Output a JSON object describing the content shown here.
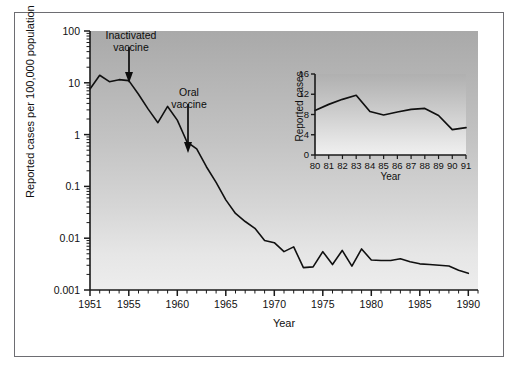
{
  "figure": {
    "background": "#ffffff",
    "frame_color": "#6d6d72",
    "panel_gradient_top": "#a9a9a9",
    "panel_gradient_bottom": "#ededed",
    "line_color": "#101010"
  },
  "chart_data": [
    {
      "type": "line",
      "id": "main-chart",
      "title": "",
      "xlabel": "Year",
      "ylabel": "Reported cases per 100,000 population",
      "yscale": "log",
      "ylim": [
        0.001,
        100
      ],
      "xlim": [
        1951,
        1991
      ],
      "grid": false,
      "legend": "none",
      "ytick_labels": [
        "100",
        "10",
        "1",
        "0.1",
        "0.01",
        "0.001"
      ],
      "ytick_values": [
        100,
        10,
        1,
        0.1,
        0.01,
        0.001
      ],
      "xtick_labels": [
        "1951",
        "1955",
        "1960",
        "1965",
        "1970",
        "1975",
        "1980",
        "1985",
        "1990"
      ],
      "xtick_values": [
        1951,
        1955,
        1960,
        1965,
        1970,
        1975,
        1980,
        1985,
        1990
      ],
      "x": [
        1951,
        1952,
        1953,
        1954,
        1955,
        1956,
        1957,
        1958,
        1959,
        1960,
        1961,
        1962,
        1963,
        1964,
        1965,
        1966,
        1967,
        1968,
        1969,
        1970,
        1971,
        1972,
        1973,
        1974,
        1975,
        1976,
        1977,
        1978,
        1979,
        1980,
        1981,
        1982,
        1983,
        1984,
        1985,
        1986,
        1987,
        1988,
        1989,
        1990
      ],
      "values": [
        7.6,
        14.0,
        10.5,
        11.5,
        11.0,
        6.0,
        3.1,
        1.7,
        3.5,
        1.9,
        0.72,
        0.53,
        0.24,
        0.12,
        0.055,
        0.03,
        0.021,
        0.0155,
        0.009,
        0.0082,
        0.0055,
        0.0068,
        0.0027,
        0.0028,
        0.0055,
        0.0031,
        0.0058,
        0.0029,
        0.0062,
        0.0038,
        0.0037,
        0.0037,
        0.004,
        0.0035,
        0.0032,
        0.0031,
        0.003,
        0.0029,
        0.0024,
        0.0021
      ],
      "annotations": [
        {
          "label_line1": "Inactivated",
          "label_line2": "vaccine",
          "points_to_year": 1955,
          "arrow": "down"
        },
        {
          "label_line1": "Oral",
          "label_line2": "vaccine",
          "points_to_year": 1961,
          "arrow": "down"
        }
      ]
    },
    {
      "type": "line",
      "id": "inset-chart",
      "title": "",
      "xlabel": "Year",
      "ylabel": "Reported cases",
      "yscale": "linear",
      "ylim": [
        0,
        16
      ],
      "grid": false,
      "legend": "none",
      "ytick_labels": [
        "0",
        "4",
        "8",
        "12",
        "16"
      ],
      "ytick_values": [
        0,
        4,
        8,
        12,
        16
      ],
      "xtick_labels": [
        "80",
        "81",
        "82",
        "83",
        "84",
        "85",
        "86",
        "87",
        "88",
        "89",
        "90",
        "91"
      ],
      "x": [
        80,
        81,
        82,
        83,
        84,
        85,
        86,
        87,
        88,
        89,
        90,
        91
      ],
      "values": [
        8.8,
        10.0,
        11.0,
        11.8,
        8.6,
        7.9,
        8.5,
        9.0,
        9.2,
        7.8,
        5.0,
        5.4
      ]
    }
  ],
  "main": {
    "ylabel": "Reported cases per 100,000 population",
    "xlabel": "Year",
    "yticks": [
      "100",
      "10",
      "1",
      "0.1",
      "0.01",
      "0.001"
    ],
    "xticks": [
      "1951",
      "1955",
      "1960",
      "1965",
      "1970",
      "1975",
      "1980",
      "1985",
      "1990"
    ],
    "annotation_inactivated_line1": "Inactivated",
    "annotation_inactivated_line2": "vaccine",
    "annotation_oral_line1": "Oral",
    "annotation_oral_line2": "vaccine"
  },
  "inset": {
    "ylabel": "Reported cases",
    "xlabel": "Year",
    "yticks": [
      "16",
      "12",
      "8",
      "4",
      "0"
    ],
    "xticks": [
      "80",
      "81",
      "82",
      "83",
      "84",
      "85",
      "86",
      "87",
      "88",
      "89",
      "90",
      "91"
    ]
  }
}
